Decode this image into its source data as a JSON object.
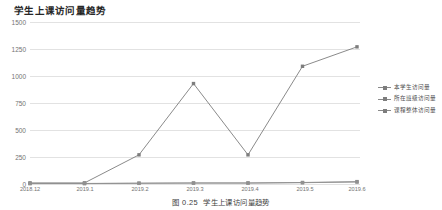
{
  "chart_title": "学生上课访问量趋势",
  "caption": {
    "number": "图 0.25",
    "text": "学生上课访问量趋势"
  },
  "legend": {
    "position": "right",
    "items": [
      {
        "label": "本学生访问量",
        "color": "#7d7d7d"
      },
      {
        "label": "所在班级访问量",
        "color": "#8a8a8a"
      },
      {
        "label": "课程整体访问量",
        "color": "#909090"
      }
    ]
  },
  "axis": {
    "y_ticks": [
      "1500",
      "1250",
      "1000",
      "750",
      "500",
      "250",
      "0"
    ],
    "x_ticks": [
      "2018.12",
      "2019.1",
      "2019.2",
      "2019.3",
      "2019.4",
      "2019.5",
      "2019.6"
    ]
  },
  "chart_data": {
    "type": "line",
    "title": "学生上课访问量趋势",
    "xlabel": "",
    "ylabel": "",
    "ylim": [
      0,
      1500
    ],
    "ytick_values": [
      0,
      250,
      500,
      750,
      1000,
      1250,
      1500
    ],
    "grid": true,
    "legend_position": "right",
    "categories": [
      "2018.12",
      "2019.1",
      "2019.2",
      "2019.3",
      "2019.4",
      "2019.5",
      "2019.6"
    ],
    "series": [
      {
        "name": "本学生访问量",
        "color": "#7d7d7d",
        "marker": "square",
        "values": [
          10,
          10,
          270,
          930,
          270,
          1090,
          1270
        ]
      },
      {
        "name": "所在班级访问量",
        "color": "#8a8a8a",
        "marker": "square",
        "values": [
          5,
          5,
          8,
          10,
          10,
          14,
          22
        ]
      },
      {
        "name": "课程整体访问量",
        "color": "#909090",
        "marker": "square",
        "values": [
          4,
          4,
          6,
          8,
          8,
          12,
          18
        ]
      }
    ]
  }
}
